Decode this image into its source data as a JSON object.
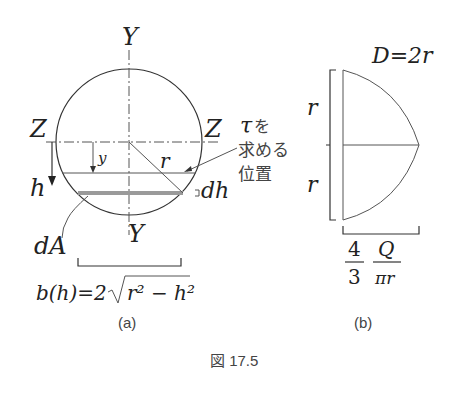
{
  "figure": {
    "caption": "図 17.5",
    "panel_a": {
      "label": "(a)",
      "axis_y_top": "Y",
      "axis_y_bottom": "Y",
      "axis_z_left": "Z",
      "axis_z_right": "Z",
      "y_label": "y",
      "h_label": "h",
      "r_label": "r",
      "dh_label": "dh",
      "dA_label": "dA",
      "tau_symbol": "τ",
      "tau_text_line1": "を",
      "tau_text_line2": "求める",
      "tau_text_line3": "位置",
      "width_formula_lhs": "b(h)=2",
      "width_formula_rhs": "r² − h²"
    },
    "panel_b": {
      "label": "(b)",
      "diameter_label": "D=2r",
      "r_upper": "r",
      "r_lower": "r",
      "frac1_num": "4",
      "frac1_den": "3",
      "frac2_num": "Q",
      "frac2_den": "πr"
    },
    "colors": {
      "stroke": "#333333",
      "strip": "#9a9a9a",
      "text": "#222222"
    }
  }
}
